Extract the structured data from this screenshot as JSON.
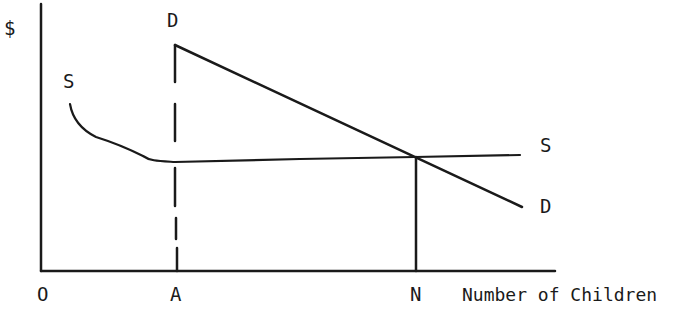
{
  "diagram": {
    "type": "supply-demand",
    "y_axis_label": "$",
    "x_axis_label": "Number of Children",
    "origin_label": "O",
    "x_markers": [
      {
        "label": "A",
        "note": "dashed vertical at demand start"
      },
      {
        "label": "N",
        "note": "equilibrium quantity"
      }
    ],
    "curves": [
      {
        "name": "D",
        "label_top": "D",
        "label_end": "D",
        "description": "downward-sloping demand line starting above A"
      },
      {
        "name": "S",
        "label_start": "S",
        "label_end": "S",
        "description": "supply curve, falling then flat"
      }
    ],
    "colors": {
      "ink": "#1a1a1a",
      "background": "#ffffff"
    }
  }
}
